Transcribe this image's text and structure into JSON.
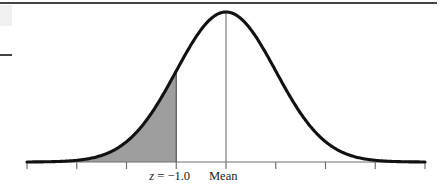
{
  "figure": {
    "kind": "normal-distribution-curve",
    "background_color": "#ffffff",
    "curve_color": "#111111",
    "shade_color": "#9e9e9e",
    "axis_color": "#6e6e6e",
    "rule_color": "#444444",
    "labels": {
      "z_prefix": "z",
      "z_equals": " = −1.0",
      "z_full": "z = −1.0",
      "mean": "Mean"
    }
  },
  "chart_data": {
    "type": "area",
    "title": "",
    "subtitle": "",
    "xlabel": "",
    "ylabel": "",
    "grid": false,
    "legend": null,
    "distribution": "standard normal",
    "mean": 0,
    "std_dev": 1,
    "xlim": [
      -4,
      4
    ],
    "ylim": [
      0,
      0.4
    ],
    "tick_labels": [
      "",
      "",
      "",
      "z = −1.0",
      "Mean",
      "",
      "",
      "",
      ""
    ],
    "tick_values": [
      -4,
      -3,
      -2,
      -1,
      0,
      1,
      2,
      3,
      4
    ],
    "tick_pixel_x": [
      27,
      77,
      127,
      176,
      226,
      276,
      326,
      376,
      425
    ],
    "annotations": [
      {
        "name": "z-line",
        "x": -1,
        "label": "z = −1.0",
        "pixel_x": 176
      },
      {
        "name": "mean-line",
        "x": 0,
        "label": "Mean",
        "pixel_x": 226
      }
    ],
    "shaded_region": {
      "from": -4,
      "to": -1,
      "color": "#9e9e9e",
      "description": "left tail area below z = −1.0"
    },
    "x": [
      -4.0,
      -3.8,
      -3.6,
      -3.4,
      -3.2,
      -3.0,
      -2.8,
      -2.6,
      -2.4,
      -2.2,
      -2.0,
      -1.8,
      -1.6,
      -1.4,
      -1.2,
      -1.0,
      -0.8,
      -0.6,
      -0.4,
      -0.2,
      0.0,
      0.2,
      0.4,
      0.6,
      0.8,
      1.0,
      1.2,
      1.4,
      1.6,
      1.8,
      2.0,
      2.2,
      2.4,
      2.6,
      2.8,
      3.0,
      3.2,
      3.4,
      3.6,
      3.8,
      4.0
    ],
    "y": [
      0.0001,
      0.0003,
      0.0006,
      0.0012,
      0.0024,
      0.0044,
      0.0079,
      0.0136,
      0.0224,
      0.0355,
      0.054,
      0.079,
      0.1109,
      0.1497,
      0.1942,
      0.242,
      0.2897,
      0.3332,
      0.3683,
      0.391,
      0.3989,
      0.391,
      0.3683,
      0.3332,
      0.2897,
      0.242,
      0.1942,
      0.1497,
      0.1109,
      0.079,
      0.054,
      0.0355,
      0.0224,
      0.0136,
      0.0079,
      0.0044,
      0.0024,
      0.0012,
      0.0006,
      0.0003,
      0.0001
    ]
  }
}
